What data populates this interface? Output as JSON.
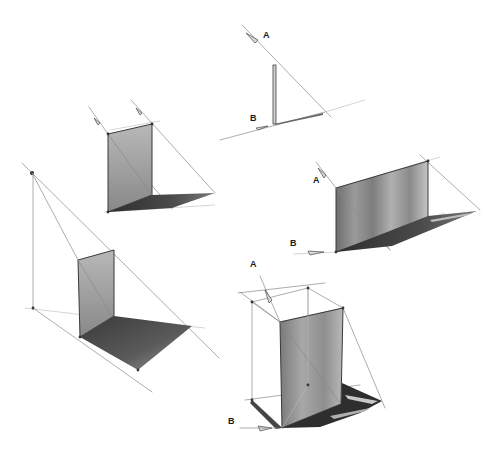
{
  "diagram": {
    "type": "perspective shadow construction sketches",
    "background": "#ffffff",
    "colors": {
      "wall_light": "#b4b4b4",
      "wall_mid": "#8c8c8c",
      "wall_dark": "#6a6a6a",
      "shadow": "#3a3a3a",
      "guide_line": "#8a8a8a",
      "label": "#1a1a1a"
    },
    "figures": [
      {
        "id": "pole",
        "description": "Vertical pole with light ray A and ground direction B casting shadow",
        "labels": [
          {
            "text": "A",
            "x": 263,
            "y": 38
          },
          {
            "text": "B",
            "x": 250,
            "y": 121
          }
        ]
      },
      {
        "id": "wall-parallel-rays",
        "description": "Vertical panel with two parallel sun rays casting shadow on ground",
        "labels": []
      },
      {
        "id": "wall-wide",
        "description": "Wide vertical panel with ray A and ground direction B",
        "labels": [
          {
            "text": "A",
            "x": 313,
            "y": 183
          },
          {
            "text": "B",
            "x": 290,
            "y": 246
          }
        ]
      },
      {
        "id": "wall-point-light",
        "description": "Vertical panel lit by point light source on a pole, shadow radiating from base",
        "labels": []
      },
      {
        "id": "box-frame",
        "description": "Wireframe box with shaded panel, ray A and ground direction B",
        "labels": [
          {
            "text": "A",
            "x": 250,
            "y": 267
          },
          {
            "text": "B",
            "x": 228,
            "y": 424
          }
        ]
      }
    ]
  }
}
